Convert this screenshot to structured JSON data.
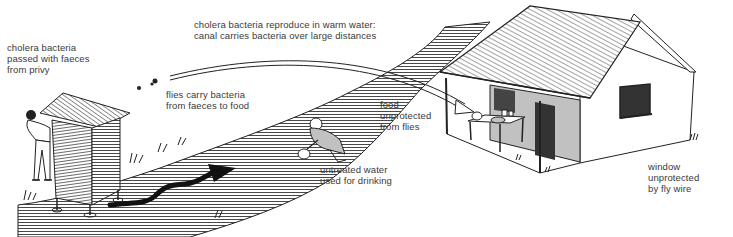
{
  "diagram": {
    "colors": {
      "ink": "#222222",
      "text": "#3a3a3a",
      "background": "#ffffff",
      "shade": "#9a9a9a"
    },
    "labels": {
      "privy": "cholera bacteria\npassed with faeces\nfrom privy",
      "canal": "cholera bacteria reproduce in warm water:\ncanal carries bacteria over large distances",
      "flies": "flies carry bacteria\nfrom faeces to food",
      "food": "food\nunprotected\nfrom flies",
      "water": "untreated water\nused for drinking",
      "window": "window\nunprotected\nby fly wire"
    },
    "elements": [
      "privy",
      "man-leaving-privy",
      "canal",
      "faeces-flow-arrow",
      "flies",
      "fly-path-arrow",
      "person-drawing-water",
      "house",
      "table-with-food",
      "window"
    ]
  }
}
